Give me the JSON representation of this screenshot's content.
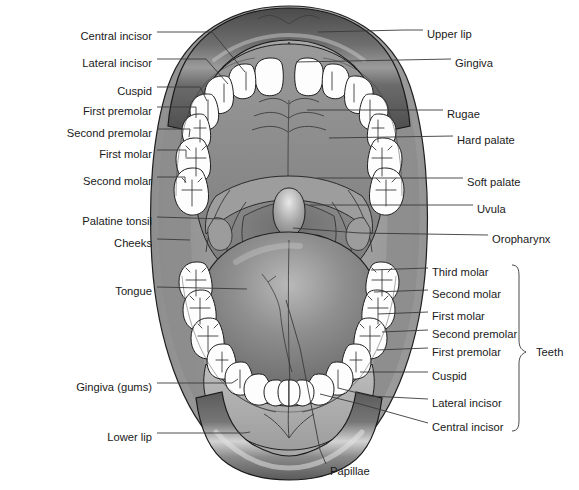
{
  "figure": {
    "type": "labeled-anatomical-diagram"
  },
  "colors": {
    "background": "#ffffff",
    "lip_dark": "#4f4f4f",
    "lip_mid": "#6e6e6e",
    "lip_light": "#bfbfbf",
    "cheek": "#9a9a9a",
    "palate": "#8d8d8d",
    "palate_light": "#b4b4b4",
    "tongue_dark": "#6a6a6a",
    "tongue_light": "#a8a8a8",
    "tooth": "#fdfdfd",
    "outline": "#1f1f1f",
    "leader": "#3a3a3a",
    "text": "#1a1a1a"
  },
  "labels_left": [
    {
      "id": "central-incisor-upper",
      "text": "Central incisor",
      "x": 152,
      "y": 36,
      "tx": 245,
      "ty": 72
    },
    {
      "id": "lateral-incisor-upper",
      "text": "Lateral incisor",
      "x": 152,
      "y": 63,
      "tx": 228,
      "ty": 84
    },
    {
      "id": "cuspid-upper",
      "text": "Cuspid",
      "x": 152,
      "y": 91,
      "tx": 207,
      "ty": 101
    },
    {
      "id": "first-premolar-upper",
      "text": "First premolar",
      "x": 152,
      "y": 111,
      "tx": 196,
      "ty": 118
    },
    {
      "id": "second-premolar-upper",
      "text": "Second premolar",
      "x": 152,
      "y": 133,
      "tx": 189,
      "ty": 137
    },
    {
      "id": "first-molar-upper",
      "text": "First molar",
      "x": 152,
      "y": 154,
      "tx": 186,
      "ty": 157
    },
    {
      "id": "second-molar-upper",
      "text": "Second molar",
      "x": 152,
      "y": 181,
      "tx": 185,
      "ty": 183
    },
    {
      "id": "palatine-tonsil",
      "text": "Palatine tonsil",
      "x": 152,
      "y": 221,
      "tx": 223,
      "ty": 223
    },
    {
      "id": "cheeks",
      "text": "Cheeks",
      "x": 152,
      "y": 243,
      "tx": 190,
      "ty": 244
    },
    {
      "id": "tongue",
      "text": "Tongue",
      "x": 152,
      "y": 291,
      "tx": 247,
      "ty": 293
    },
    {
      "id": "gingiva-gums",
      "text": "Gingiva (gums)",
      "x": 152,
      "y": 387,
      "tx": 238,
      "ty": 381
    },
    {
      "id": "lower-lip",
      "text": "Lower lip",
      "x": 152,
      "y": 437,
      "tx": 248,
      "ty": 434
    }
  ],
  "labels_right": [
    {
      "id": "upper-lip",
      "text": "Upper lip",
      "x": 427,
      "y": 34,
      "tx": 318,
      "ty": 34
    },
    {
      "id": "gingiva",
      "text": "Gingiva",
      "x": 455,
      "y": 63,
      "tx": 296,
      "ty": 64
    },
    {
      "id": "rugae",
      "text": "Rugae",
      "x": 447,
      "y": 114,
      "tx": 307,
      "ty": 112
    },
    {
      "id": "hard-palate",
      "text": "Hard palate",
      "x": 457,
      "y": 140,
      "tx": 329,
      "ty": 140
    },
    {
      "id": "soft-palate",
      "text": "Soft palate",
      "x": 467,
      "y": 182,
      "tx": 317,
      "ty": 180
    },
    {
      "id": "uvula",
      "text": "Uvula",
      "x": 477,
      "y": 209,
      "tx": 310,
      "ty": 207
    },
    {
      "id": "oropharynx",
      "text": "Oropharynx",
      "x": 492,
      "y": 239,
      "tx": 293,
      "ty": 230
    },
    {
      "id": "third-molar-lower",
      "text": "Third molar",
      "x": 432,
      "y": 272,
      "tx": 371,
      "ty": 272
    },
    {
      "id": "second-molar-lower",
      "text": "Second molar",
      "x": 432,
      "y": 294,
      "tx": 374,
      "ty": 294
    },
    {
      "id": "first-molar-lower",
      "text": "First molar",
      "x": 432,
      "y": 316,
      "tx": 378,
      "ty": 316
    },
    {
      "id": "second-premolar-lower",
      "text": "Second premolar",
      "x": 432,
      "y": 334,
      "tx": 382,
      "ty": 334
    },
    {
      "id": "first-premolar-lower",
      "text": "First premolar",
      "x": 432,
      "y": 352,
      "tx": 377,
      "ty": 352
    },
    {
      "id": "cuspid-lower",
      "text": "Cuspid",
      "x": 432,
      "y": 376,
      "tx": 360,
      "ty": 374
    },
    {
      "id": "lateral-incisor-lower",
      "text": "Lateral incisor",
      "x": 432,
      "y": 403,
      "tx": 338,
      "ty": 386
    },
    {
      "id": "central-incisor-lower",
      "text": "Central incisor",
      "x": 432,
      "y": 427,
      "tx": 320,
      "ty": 392
    }
  ],
  "labels_bottom": [
    {
      "id": "papillae",
      "text": "Papillae",
      "x": 330,
      "y": 471,
      "tx": 312,
      "ty": 443
    }
  ],
  "bracket": {
    "label": "Teeth",
    "label_x": 536,
    "label_y": 352,
    "top_y": 265,
    "bottom_y": 431,
    "x": 519
  }
}
